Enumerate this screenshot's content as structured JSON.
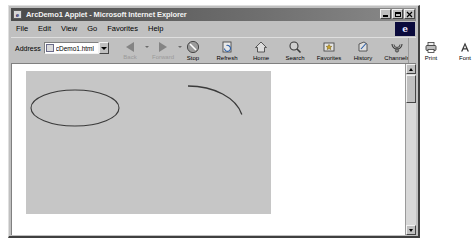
{
  "window": {
    "title": "ArcDemo1 Applet - Microsoft Internet Explorer",
    "title_icon": "e",
    "minimize_label": "_",
    "maximize_label": "□",
    "close_label": "×"
  },
  "menu": {
    "items": [
      {
        "label": "File"
      },
      {
        "label": "Edit"
      },
      {
        "label": "View"
      },
      {
        "label": "Go"
      },
      {
        "label": "Favorites"
      },
      {
        "label": "Help"
      }
    ],
    "logo": "e"
  },
  "toolbar": {
    "address_label": "Address",
    "address_value": "cDemo1.html",
    "nav": [
      {
        "label": "Back"
      },
      {
        "label": "Forward"
      }
    ],
    "buttons": [
      {
        "label": "Stop",
        "icon": "stop-icon"
      },
      {
        "label": "Refresh",
        "icon": "refresh-icon"
      },
      {
        "label": "Home",
        "icon": "home-icon"
      },
      {
        "label": "Search",
        "icon": "search-icon"
      },
      {
        "label": "Favorites",
        "icon": "favorites-icon"
      },
      {
        "label": "History",
        "icon": "history-icon"
      },
      {
        "label": "Channels",
        "icon": "channels-icon"
      },
      {
        "label": "Print",
        "icon": "print-icon"
      },
      {
        "label": "Font",
        "icon": "font-icon"
      }
    ]
  },
  "applet": {
    "background_color": "#c6c6c6",
    "stroke_color": "#3a3a3a",
    "shapes": [
      {
        "name": "full-ellipse",
        "type": "ellipse",
        "cx": 49,
        "cy": 37,
        "rx": 44,
        "ry": 18,
        "start_angle": 0,
        "arc_angle": 360
      },
      {
        "name": "quarter-arc",
        "type": "arc",
        "cx": 162,
        "cy": 51,
        "rx": 55,
        "ry": 36,
        "start_angle": 90,
        "arc_angle": -78
      }
    ]
  },
  "scrollbar": {
    "up_label": "▲",
    "down_label": "▼"
  }
}
